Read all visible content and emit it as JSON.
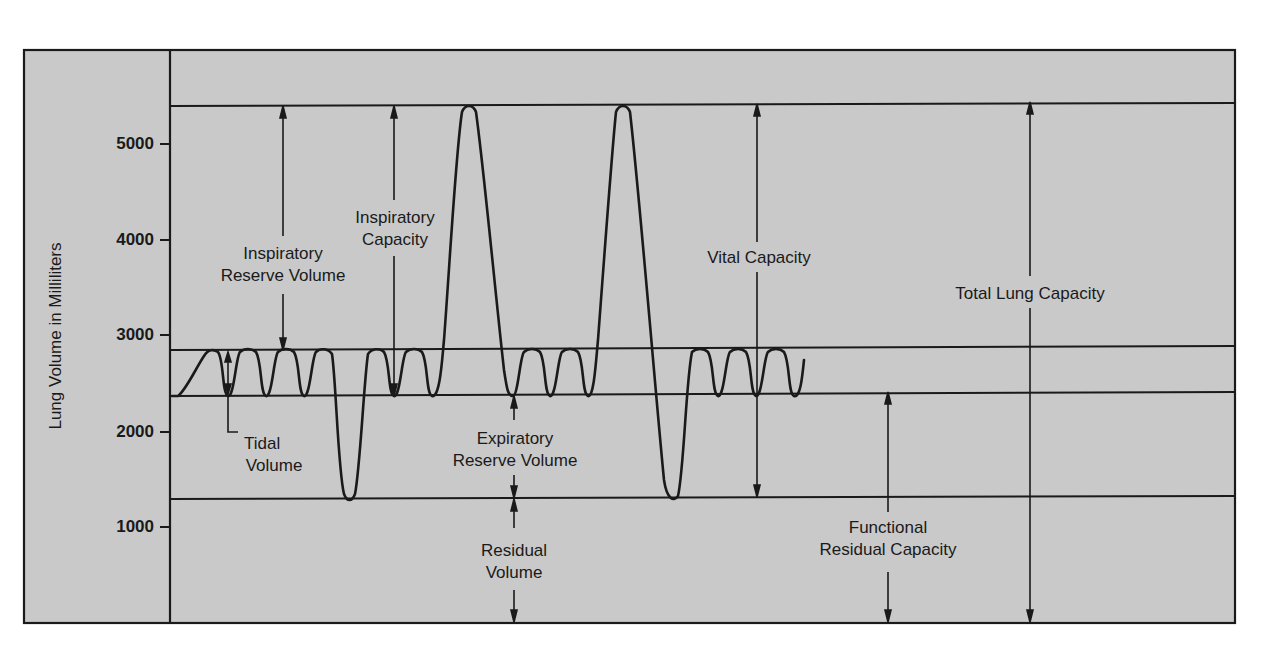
{
  "colors": {
    "panel_bg": "#c9c9c9",
    "line": "#1a1a1a",
    "page_bg": "#ffffff"
  },
  "axis": {
    "ylabel": "Lung Volume in Milliliters",
    "ticks": [
      {
        "label": "5000",
        "value": 5000
      },
      {
        "label": "4000",
        "value": 4000
      },
      {
        "label": "3000",
        "value": 3000
      },
      {
        "label": "2000",
        "value": 2000
      },
      {
        "label": "1000",
        "value": 1000
      }
    ]
  },
  "levels": {
    "total_lung_capacity_ml": 5400,
    "end_inspiration_ml": 2850,
    "end_expiration_ml": 2400,
    "residual_volume_ml": 1300,
    "zero_ml": 0
  },
  "labels": {
    "irv_line1": "Inspiratory",
    "irv_line2": "Reserve Volume",
    "ic_line1": "Inspiratory",
    "ic_line2": "Capacity",
    "tidal_line1": "Tidal",
    "tidal_line2": "Volume",
    "erv_line1": "Expiratory",
    "erv_line2": "Reserve Volume",
    "rv_line1": "Residual",
    "rv_line2": "Volume",
    "vc": "Vital Capacity",
    "frc_line1": "Functional",
    "frc_line2": "Residual Capacity",
    "tlc": "Total Lung Capacity"
  }
}
